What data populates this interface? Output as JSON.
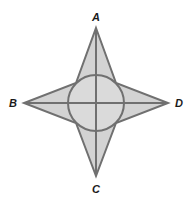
{
  "diagram": {
    "type": "four-pointed-star-with-inscribed-circle",
    "colors": {
      "fill": "#d3d3d3",
      "stroke": "#707070",
      "label": "#1a1a1a",
      "background": "#ffffff"
    },
    "center": [
      96,
      103
    ],
    "circle_radius": 28,
    "points": {
      "A": {
        "label": "A",
        "tip": [
          96,
          28
        ],
        "label_pos": [
          96,
          21
        ]
      },
      "B": {
        "label": "B",
        "tip": [
          24,
          103
        ],
        "label_pos": [
          13,
          107
        ]
      },
      "C": {
        "label": "C",
        "tip": [
          96,
          176
        ],
        "label_pos": [
          96,
          193
        ]
      },
      "D": {
        "label": "D",
        "tip": [
          168,
          103
        ],
        "label_pos": [
          179,
          107
        ]
      }
    },
    "segments": [
      {
        "from": "A",
        "to": "C"
      },
      {
        "from": "B",
        "to": "D"
      }
    ]
  }
}
